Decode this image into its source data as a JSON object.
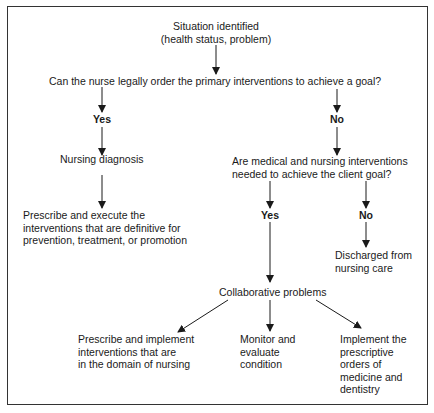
{
  "diagram": {
    "type": "flowchart",
    "nodes": {
      "situation": {
        "line1": "Situation identified",
        "line2": "(health status, problem)"
      },
      "question1": "Can the nurse legally order the primary interventions to achieve a goal?",
      "yes1": "Yes",
      "no1": "No",
      "nursing_diagnosis": "Nursing diagnosis",
      "prescribe_execute": {
        "line1": "Prescribe and execute the",
        "line2": "interventions that are definitive for",
        "line3": "prevention, treatment, or promotion"
      },
      "question2": {
        "line1": "Are medical and nursing interventions",
        "line2": "needed to achieve the client goal?"
      },
      "yes2": "Yes",
      "no2": "No",
      "discharged": {
        "line1": "Discharged from",
        "line2": "nursing care"
      },
      "collaborative": "Collaborative problems",
      "prescribe_implement": {
        "line1": "Prescribe and implement",
        "line2": "interventions that are",
        "line3": "in the domain of nursing"
      },
      "monitor": {
        "line1": "Monitor and",
        "line2": "evaluate",
        "line3": "condition"
      },
      "implement_orders": {
        "line1": "Implement the",
        "line2": "prescriptive",
        "line3": "orders of",
        "line4": "medicine and",
        "line5": "dentistry"
      }
    },
    "edges": [
      [
        "situation",
        "question1"
      ],
      [
        "question1",
        "yes1"
      ],
      [
        "question1",
        "no1"
      ],
      [
        "yes1",
        "nursing_diagnosis"
      ],
      [
        "nursing_diagnosis",
        "prescribe_execute"
      ],
      [
        "no1",
        "question2"
      ],
      [
        "question2",
        "yes2"
      ],
      [
        "question2",
        "no2"
      ],
      [
        "no2",
        "discharged"
      ],
      [
        "yes2",
        "collaborative"
      ],
      [
        "collaborative",
        "prescribe_implement"
      ],
      [
        "collaborative",
        "monitor"
      ],
      [
        "collaborative",
        "implement_orders"
      ]
    ]
  }
}
